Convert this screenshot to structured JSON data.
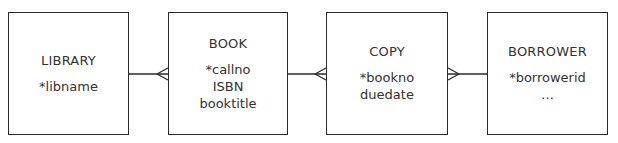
{
  "diagram": {
    "type": "entity-relationship",
    "notation": "crows-foot",
    "entities": [
      {
        "name": "LIBRARY",
        "attributes": [
          "*libname"
        ]
      },
      {
        "name": "BOOK",
        "attributes": [
          "*callno",
          "ISBN",
          "booktitle"
        ]
      },
      {
        "name": "COPY",
        "attributes": [
          "*bookno",
          "duedate"
        ]
      },
      {
        "name": "BORROWER",
        "attributes": [
          "*borrowerid",
          "…"
        ]
      }
    ],
    "relationships": [
      {
        "from": "LIBRARY",
        "to": "BOOK",
        "cardinality": "one-to-many",
        "many_end": "BOOK"
      },
      {
        "from": "BOOK",
        "to": "COPY",
        "cardinality": "one-to-many",
        "many_end": "COPY"
      },
      {
        "from": "COPY",
        "to": "BORROWER",
        "cardinality": "many-to-one",
        "many_end": "COPY"
      }
    ]
  }
}
